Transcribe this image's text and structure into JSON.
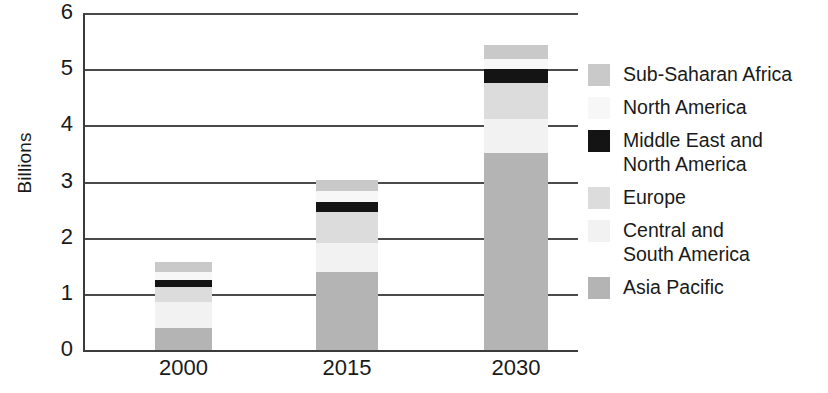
{
  "chart_data": {
    "type": "bar",
    "stacked": true,
    "title": "",
    "subtitle": "",
    "xlabel": "",
    "ylabel": "Billions",
    "categories": [
      "2000",
      "2015",
      "2030"
    ],
    "ylim": [
      0,
      6
    ],
    "yticks": [
      0,
      1,
      2,
      3,
      4,
      5,
      6
    ],
    "ytick_labels": [
      "0",
      "1",
      "2",
      "3",
      "4",
      "5",
      "6"
    ],
    "grid": "horizontal",
    "legend_position": "right",
    "series": [
      {
        "name": "Asia Pacific",
        "color": "#b4b4b4",
        "values": [
          0.4,
          1.39,
          3.5
        ]
      },
      {
        "name": "Central and\nSouth America",
        "color": "#f2f2f2",
        "values": [
          0.45,
          0.52,
          0.62
        ]
      },
      {
        "name": "Europe",
        "color": "#dcdcdc",
        "values": [
          0.27,
          0.54,
          0.64
        ]
      },
      {
        "name": "Middle East and\nNorth America",
        "color": "#141414",
        "values": [
          0.13,
          0.18,
          0.25
        ]
      },
      {
        "name": "North America",
        "color": "#f7f7f7",
        "values": [
          0.14,
          0.2,
          0.18
        ]
      },
      {
        "name": "Sub-Saharan Africa",
        "color": "#c9c9c9",
        "values": [
          0.18,
          0.2,
          0.24
        ]
      }
    ],
    "totals": [
      1.57,
      3.03,
      5.43
    ],
    "annotations": []
  },
  "legend": {
    "items": [
      {
        "label": "Sub-Saharan Africa",
        "color": "#c9c9c9"
      },
      {
        "label": "North America",
        "color": "#f7f7f7"
      },
      {
        "label": "Middle East and\nNorth America",
        "color": "#141414"
      },
      {
        "label": "Europe",
        "color": "#dcdcdc"
      },
      {
        "label": "Central and\nSouth America",
        "color": "#f2f2f2"
      },
      {
        "label": "Asia Pacific",
        "color": "#b4b4b4"
      }
    ]
  },
  "axes": {
    "y_title": "Billions",
    "y_tick_labels": [
      "6",
      "5",
      "4",
      "3",
      "2",
      "1",
      "0"
    ],
    "x_tick_labels": [
      "2000",
      "2015",
      "2030"
    ]
  },
  "colors": {
    "axis": "#3b3b3b",
    "grid": "#4a4a4a",
    "text": "#1a1a1a",
    "background": "#ffffff"
  }
}
